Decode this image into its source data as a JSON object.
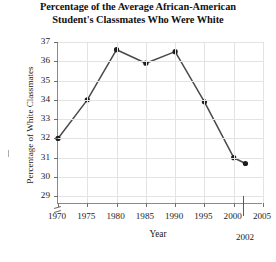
{
  "chart_data": {
    "type": "line",
    "title": "Percentage of the Average African-American Student's Classmates Who Were White",
    "title_lines": [
      "Percentage of the Average African-American",
      "Student's Classmates Who Were White"
    ],
    "xlabel": "Year",
    "ylabel": "Percentage of White Classmates",
    "x": [
      1970,
      1975,
      1980,
      1985,
      1990,
      1995,
      2000,
      2002
    ],
    "values": [
      32.0,
      34.0,
      36.6,
      35.9,
      36.5,
      33.9,
      31.0,
      30.7
    ],
    "xlim": [
      1970,
      2005
    ],
    "ylim": [
      28.6,
      37
    ],
    "ytick_labels": [
      "37",
      "36",
      "35",
      "34",
      "33",
      "32",
      "31",
      "30",
      "29"
    ],
    "ytick_values": [
      37,
      36,
      35,
      34,
      33,
      32,
      31,
      30,
      29
    ],
    "xtick_labels": [
      "1970",
      "1975",
      "1980",
      "1985",
      "1990",
      "1995",
      "2000",
      "2005"
    ],
    "xtick_values": [
      1970,
      1975,
      1980,
      1985,
      1990,
      1995,
      2000,
      2005
    ],
    "grid": true,
    "legend": null,
    "y_axis_break": true,
    "annotations": [
      {
        "label": "2002",
        "x": 2002,
        "type": "x-axis-marker"
      }
    ]
  }
}
